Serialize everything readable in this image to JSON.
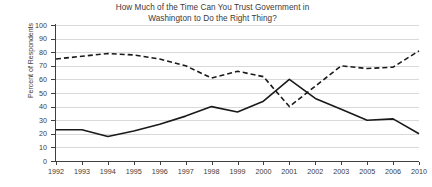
{
  "chart_data": {
    "type": "line",
    "title": "How Much of the Time Can You Trust Government in Washington to Do the Right Thing?",
    "title_line1": "How Much of the Time Can You Trust Government in",
    "title_line2": "Washington to Do the Right Thing?",
    "xlabel": "",
    "ylabel": "Percent of Respondents",
    "ylim": [
      0,
      100
    ],
    "ytick_labels": [
      "100",
      "90",
      "80",
      "70",
      "60",
      "50",
      "40",
      "30",
      "20",
      "10",
      "0"
    ],
    "yticks": [
      100,
      90,
      80,
      70,
      60,
      50,
      40,
      30,
      20,
      10,
      0
    ],
    "grid": true,
    "legend": "none",
    "categories": [
      "1992",
      "1993",
      "1994",
      "1995",
      "1996",
      "1997",
      "1998",
      "1999",
      "2000",
      "2001",
      "2002",
      "2003",
      "2005",
      "2006",
      "2010"
    ],
    "series": [
      {
        "name": "Only some of the time / never",
        "style": "dashed",
        "color": "#1a1a1a",
        "values": [
          75,
          77,
          79,
          78,
          75,
          70,
          61,
          66,
          62,
          40,
          55,
          70,
          68,
          69,
          81
        ]
      },
      {
        "name": "Just about always / most of the time",
        "style": "solid",
        "color": "#1a1a1a",
        "values": [
          23,
          23,
          18,
          22,
          27,
          33,
          40,
          36,
          44,
          60,
          46,
          38,
          30,
          31,
          20
        ]
      }
    ]
  }
}
